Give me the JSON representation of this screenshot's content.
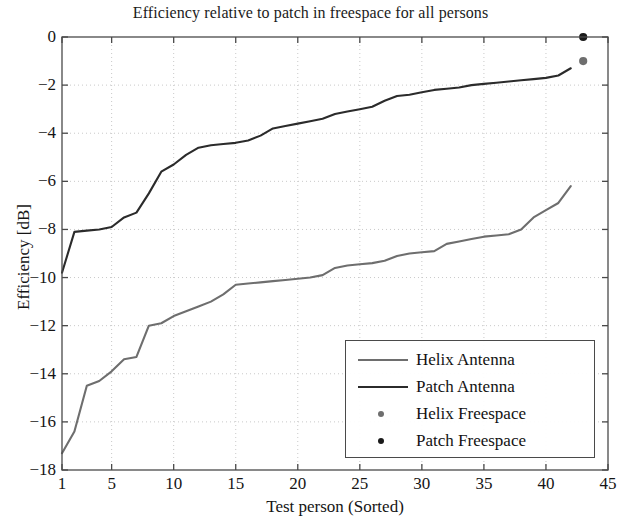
{
  "chart_data": {
    "type": "line",
    "title": "Efficiency relative to patch in freespace for all persons",
    "xlabel": "Test person (Sorted)",
    "ylabel": "Efficiency [dB]",
    "xlim": [
      1,
      45
    ],
    "ylim": [
      -18,
      0
    ],
    "xticks": [
      1,
      5,
      10,
      15,
      20,
      25,
      30,
      35,
      40,
      45
    ],
    "yticks": [
      0,
      -2,
      -4,
      -6,
      -8,
      -10,
      -12,
      -14,
      -16,
      -18
    ],
    "grid": true,
    "legend_position": "lower right",
    "colors": {
      "helix": "#6e6e6e",
      "patch": "#2b2b2b",
      "axis": "#4a4a4a",
      "grid": "#c9c9c9",
      "background": "#ffffff"
    },
    "series": [
      {
        "name": "Helix Antenna",
        "kind": "line",
        "color": "#6e6e6e",
        "x": [
          1,
          2,
          3,
          4,
          5,
          6,
          7,
          8,
          9,
          10,
          11,
          12,
          13,
          14,
          15,
          16,
          17,
          18,
          19,
          20,
          21,
          22,
          23,
          24,
          25,
          26,
          27,
          28,
          29,
          30,
          31,
          32,
          33,
          34,
          35,
          36,
          37,
          38,
          39,
          40,
          41,
          42
        ],
        "y": [
          -17.3,
          -16.4,
          -14.5,
          -14.3,
          -13.9,
          -13.4,
          -13.3,
          -12.0,
          -11.9,
          -11.6,
          -11.4,
          -11.2,
          -11.0,
          -10.7,
          -10.3,
          -10.25,
          -10.2,
          -10.15,
          -10.1,
          -10.05,
          -10.0,
          -9.9,
          -9.6,
          -9.5,
          -9.45,
          -9.4,
          -9.3,
          -9.1,
          -9.0,
          -8.95,
          -8.9,
          -8.6,
          -8.5,
          -8.4,
          -8.3,
          -8.25,
          -8.2,
          -8.0,
          -7.5,
          -7.2,
          -6.9,
          -6.2
        ]
      },
      {
        "name": "Patch Antenna",
        "kind": "line",
        "color": "#2b2b2b",
        "x": [
          1,
          2,
          3,
          4,
          5,
          6,
          7,
          8,
          9,
          10,
          11,
          12,
          13,
          14,
          15,
          16,
          17,
          18,
          19,
          20,
          21,
          22,
          23,
          24,
          25,
          26,
          27,
          28,
          29,
          30,
          31,
          32,
          33,
          34,
          35,
          36,
          37,
          38,
          39,
          40,
          41,
          42
        ],
        "y": [
          -9.8,
          -8.1,
          -8.05,
          -8.0,
          -7.9,
          -7.5,
          -7.3,
          -6.5,
          -5.6,
          -5.3,
          -4.9,
          -4.6,
          -4.5,
          -4.45,
          -4.4,
          -4.3,
          -4.1,
          -3.8,
          -3.7,
          -3.6,
          -3.5,
          -3.4,
          -3.2,
          -3.1,
          -3.0,
          -2.9,
          -2.65,
          -2.45,
          -2.4,
          -2.3,
          -2.2,
          -2.15,
          -2.1,
          -2.0,
          -1.95,
          -1.9,
          -1.85,
          -1.8,
          -1.75,
          -1.7,
          -1.6,
          -1.3
        ]
      },
      {
        "name": "Helix Freespace",
        "kind": "marker",
        "color": "#6e6e6e",
        "x": [
          43
        ],
        "y": [
          -1.0
        ]
      },
      {
        "name": "Patch Freespace",
        "kind": "marker",
        "color": "#1a1a1a",
        "x": [
          43
        ],
        "y": [
          0.0
        ]
      }
    ]
  },
  "legend": {
    "entries": [
      {
        "label": "Helix Antenna",
        "kind": "line",
        "color": "#6e6e6e"
      },
      {
        "label": "Patch Antenna",
        "kind": "line",
        "color": "#2b2b2b"
      },
      {
        "label": "Helix Freespace",
        "kind": "marker",
        "color": "#6e6e6e"
      },
      {
        "label": "Patch Freespace",
        "kind": "marker",
        "color": "#1a1a1a"
      }
    ]
  }
}
